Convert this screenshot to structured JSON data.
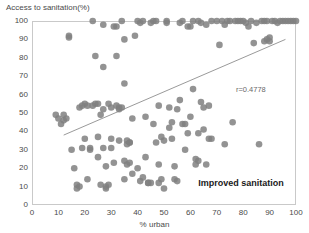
{
  "chart_data": {
    "type": "scatter",
    "title": "",
    "ylabel": "Access to sanitation(%)",
    "xlabel": "% urban",
    "xlim": [
      0,
      100
    ],
    "ylim": [
      0,
      100
    ],
    "xticks": [
      0,
      10,
      20,
      30,
      40,
      50,
      60,
      70,
      80,
      90,
      100
    ],
    "yticks": [
      0,
      10,
      20,
      30,
      40,
      50,
      60,
      70,
      80,
      90,
      100
    ],
    "grid": false,
    "legend_position": "none",
    "series_label": "Improved sanitation",
    "correlation_label": "r=0.4778",
    "correlation_value": 0.4778,
    "marker_color": "#808080",
    "marker_size": 3.3,
    "trendline": {
      "color": "#9a9a9a",
      "x_start": 12,
      "y_start": 38,
      "x_end": 96,
      "y_end": 90
    },
    "axis_color": "#c9c9c9",
    "text_color": "#4a4a4a",
    "points": [
      [
        9,
        49
      ],
      [
        10,
        47
      ],
      [
        11,
        44
      ],
      [
        12,
        46
      ],
      [
        12,
        49
      ],
      [
        13,
        47
      ],
      [
        14,
        91
      ],
      [
        14,
        92
      ],
      [
        15,
        30
      ],
      [
        16,
        20
      ],
      [
        17,
        11
      ],
      [
        17,
        9
      ],
      [
        18,
        10
      ],
      [
        18,
        53
      ],
      [
        19,
        54
      ],
      [
        19,
        31
      ],
      [
        20,
        55
      ],
      [
        20,
        36
      ],
      [
        21,
        54
      ],
      [
        21,
        14
      ],
      [
        22,
        30
      ],
      [
        22,
        31
      ],
      [
        23,
        54
      ],
      [
        23,
        100
      ],
      [
        24,
        81
      ],
      [
        25,
        26
      ],
      [
        25,
        37
      ],
      [
        26,
        49
      ],
      [
        26,
        11
      ],
      [
        27,
        75
      ],
      [
        27,
        98
      ],
      [
        27,
        31
      ],
      [
        27,
        52
      ],
      [
        28,
        21
      ],
      [
        28,
        9
      ],
      [
        28,
        10
      ],
      [
        29,
        55
      ],
      [
        29,
        11
      ],
      [
        30,
        36
      ],
      [
        30,
        31
      ],
      [
        30,
        53
      ],
      [
        31,
        23
      ],
      [
        31,
        97
      ],
      [
        32,
        97
      ],
      [
        32,
        54
      ],
      [
        32,
        81
      ],
      [
        33,
        53
      ],
      [
        33,
        35
      ],
      [
        34,
        100
      ],
      [
        35,
        90
      ],
      [
        35,
        66
      ],
      [
        35,
        24
      ],
      [
        35,
        14
      ],
      [
        36,
        33
      ],
      [
        36,
        35
      ],
      [
        36,
        22
      ],
      [
        37,
        23
      ],
      [
        37,
        34
      ],
      [
        37,
        34
      ],
      [
        38,
        17
      ],
      [
        38,
        47
      ],
      [
        39,
        92
      ],
      [
        40,
        100
      ],
      [
        40,
        20
      ],
      [
        41,
        13
      ],
      [
        42,
        15
      ],
      [
        43,
        26
      ],
      [
        43,
        48
      ],
      [
        44,
        12
      ],
      [
        44,
        12
      ],
      [
        45,
        99
      ],
      [
        45,
        12
      ],
      [
        46,
        44
      ],
      [
        46,
        100
      ],
      [
        47,
        100
      ],
      [
        47,
        34
      ],
      [
        48,
        54
      ],
      [
        48,
        22
      ],
      [
        48,
        12
      ],
      [
        49,
        14
      ],
      [
        49,
        37
      ],
      [
        50,
        9
      ],
      [
        50,
        35
      ],
      [
        51,
        99
      ],
      [
        51,
        100
      ],
      [
        52,
        53
      ],
      [
        52,
        42
      ],
      [
        53,
        45
      ],
      [
        53,
        36
      ],
      [
        54,
        21
      ],
      [
        54,
        14
      ],
      [
        55,
        52
      ],
      [
        55,
        13
      ],
      [
        56,
        57
      ],
      [
        57,
        100
      ],
      [
        57,
        44
      ],
      [
        58,
        44
      ],
      [
        58,
        30
      ],
      [
        59,
        97
      ],
      [
        59,
        39
      ],
      [
        60,
        48
      ],
      [
        60,
        97
      ],
      [
        61,
        100
      ],
      [
        61,
        63
      ],
      [
        62,
        25
      ],
      [
        62,
        22
      ],
      [
        63,
        100
      ],
      [
        63,
        39
      ],
      [
        63,
        24
      ],
      [
        64,
        99
      ],
      [
        65,
        41
      ],
      [
        65,
        53
      ],
      [
        66,
        22
      ],
      [
        66,
        98
      ],
      [
        67,
        54
      ],
      [
        68,
        100
      ],
      [
        68,
        36
      ],
      [
        70,
        100
      ],
      [
        71,
        87
      ],
      [
        72,
        100
      ],
      [
        73,
        98
      ],
      [
        74,
        100
      ],
      [
        75,
        100
      ],
      [
        76,
        45
      ],
      [
        77,
        100
      ],
      [
        78,
        100
      ],
      [
        79,
        100
      ],
      [
        80,
        100
      ],
      [
        81,
        99
      ],
      [
        82,
        97
      ],
      [
        83,
        100
      ],
      [
        84,
        88
      ],
      [
        85,
        99
      ],
      [
        86,
        33
      ],
      [
        87,
        100
      ],
      [
        88,
        100
      ],
      [
        89,
        100
      ],
      [
        90,
        91
      ],
      [
        91,
        100
      ],
      [
        92,
        100
      ],
      [
        93,
        99
      ],
      [
        94,
        100
      ],
      [
        95,
        100
      ],
      [
        96,
        100
      ],
      [
        97,
        100
      ],
      [
        98,
        100
      ],
      [
        99,
        100
      ],
      [
        100,
        100
      ],
      [
        88,
        89
      ],
      [
        89,
        90
      ],
      [
        90,
        89
      ],
      [
        24,
        55
      ],
      [
        25,
        55
      ],
      [
        34,
        53
      ],
      [
        33,
        52
      ],
      [
        41,
        99
      ],
      [
        42,
        100
      ],
      [
        56,
        99
      ],
      [
        64,
        56
      ],
      [
        67,
        36
      ],
      [
        73,
        33
      ]
    ]
  }
}
